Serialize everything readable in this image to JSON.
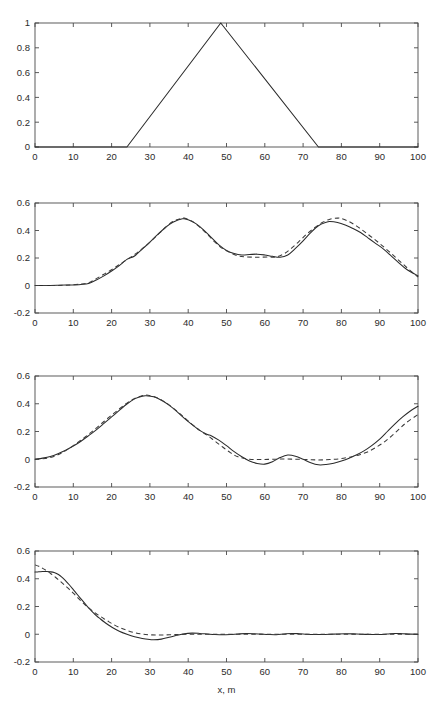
{
  "figure": {
    "background": "#ffffff",
    "line_color": "#2a2a2a",
    "axis_color": "#4a4a4a",
    "x_axis_label": "x, m"
  },
  "chart_data": [
    {
      "type": "line",
      "panel_index": 1,
      "panel_name": "initial-triangular-pulse",
      "title": "",
      "xlabel": "",
      "ylabel": "",
      "xlim": [
        0,
        100
      ],
      "ylim": [
        0,
        1
      ],
      "xticks": [
        0,
        10,
        20,
        30,
        40,
        50,
        60,
        70,
        80,
        90,
        100
      ],
      "yticks": [
        0,
        0.2,
        0.4,
        0.6,
        0.8,
        1
      ],
      "xticklabels": [
        "0",
        "10",
        "20",
        "30",
        "40",
        "50",
        "60",
        "70",
        "80",
        "90",
        "100"
      ],
      "yticklabels": [
        "0",
        "0.2",
        "0.4",
        "0.6",
        "0.8",
        "1"
      ],
      "grid": false,
      "legend": null,
      "series": [
        {
          "name": "triangular pulse",
          "style": "solid",
          "x": [
            0,
            24,
            48.5,
            74,
            100
          ],
          "y": [
            0,
            0,
            1,
            0,
            0
          ]
        }
      ]
    },
    {
      "type": "line",
      "panel_index": 2,
      "panel_name": "double-hump-response",
      "title": "",
      "xlabel": "",
      "ylabel": "",
      "xlim": [
        0,
        100
      ],
      "ylim": [
        -0.2,
        0.6
      ],
      "xticks": [
        0,
        10,
        20,
        30,
        40,
        50,
        60,
        70,
        80,
        90,
        100
      ],
      "yticks": [
        -0.2,
        0,
        0.2,
        0.4,
        0.6
      ],
      "xticklabels": [
        "0",
        "10",
        "20",
        "30",
        "40",
        "50",
        "60",
        "70",
        "80",
        "90",
        "100"
      ],
      "yticklabels": [
        "-0.2",
        "0",
        "0.2",
        "0.4",
        "0.6"
      ],
      "grid": false,
      "legend": null,
      "series": [
        {
          "name": "computed (solid)",
          "style": "solid",
          "x": [
            0,
            4,
            8,
            12,
            14,
            16,
            18,
            20,
            22,
            24,
            26,
            28,
            30,
            32,
            34,
            36,
            38.5,
            40,
            42,
            44,
            46,
            48,
            50,
            52,
            54,
            56,
            58,
            60,
            62,
            64,
            66,
            68,
            70,
            72,
            74,
            76,
            77,
            79,
            81,
            83,
            85,
            87,
            89,
            91,
            93,
            95,
            97,
            100
          ],
          "y": [
            0.0,
            0.0,
            0.003,
            0.008,
            0.015,
            0.04,
            0.07,
            0.105,
            0.145,
            0.19,
            0.215,
            0.265,
            0.315,
            0.37,
            0.42,
            0.46,
            0.485,
            0.478,
            0.45,
            0.405,
            0.35,
            0.295,
            0.255,
            0.232,
            0.222,
            0.225,
            0.228,
            0.222,
            0.212,
            0.205,
            0.222,
            0.27,
            0.325,
            0.385,
            0.435,
            0.46,
            0.465,
            0.458,
            0.44,
            0.415,
            0.385,
            0.345,
            0.305,
            0.265,
            0.215,
            0.165,
            0.118,
            0.07
          ]
        },
        {
          "name": "reference (dashed)",
          "style": "dashed",
          "x": [
            0,
            4,
            8,
            12,
            14,
            16,
            18,
            20,
            22,
            24,
            26,
            28,
            30,
            32,
            34,
            36,
            38,
            39,
            41,
            43,
            45,
            47,
            49,
            51,
            53,
            55,
            58,
            61,
            63,
            65,
            67,
            69,
            71,
            73,
            75,
            77,
            79,
            80,
            82,
            84,
            86,
            88,
            90,
            92,
            94,
            96,
            98,
            100
          ],
          "y": [
            0.0,
            0.0,
            0.002,
            0.01,
            0.02,
            0.05,
            0.082,
            0.115,
            0.152,
            0.188,
            0.225,
            0.268,
            0.315,
            0.368,
            0.422,
            0.465,
            0.487,
            0.49,
            0.468,
            0.425,
            0.372,
            0.315,
            0.268,
            0.238,
            0.215,
            0.208,
            0.206,
            0.207,
            0.208,
            0.23,
            0.272,
            0.322,
            0.375,
            0.42,
            0.458,
            0.482,
            0.49,
            0.487,
            0.465,
            0.432,
            0.392,
            0.35,
            0.305,
            0.258,
            0.208,
            0.158,
            0.108,
            0.062
          ]
        }
      ]
    },
    {
      "type": "line",
      "panel_index": 3,
      "panel_name": "single-hump-response",
      "title": "",
      "xlabel": "",
      "ylabel": "",
      "xlim": [
        0,
        100
      ],
      "ylim": [
        -0.2,
        0.6
      ],
      "xticks": [
        0,
        10,
        20,
        30,
        40,
        50,
        60,
        70,
        80,
        90,
        100
      ],
      "yticks": [
        -0.2,
        0,
        0.2,
        0.4,
        0.6
      ],
      "xticklabels": [
        "0",
        "10",
        "20",
        "30",
        "40",
        "50",
        "60",
        "70",
        "80",
        "90",
        "100"
      ],
      "yticklabels": [
        "-0.2",
        "0",
        "0.2",
        "0.4",
        "0.6"
      ],
      "grid": false,
      "legend": null,
      "series": [
        {
          "name": "computed (solid)",
          "style": "solid",
          "x": [
            0,
            2,
            4,
            6,
            8,
            10,
            12,
            14,
            16,
            18,
            20,
            22,
            24,
            26,
            28,
            29,
            31,
            33,
            35,
            37,
            39,
            41,
            43,
            45,
            46,
            48,
            50,
            52,
            54,
            56,
            58,
            60,
            62,
            64,
            66,
            68,
            70,
            72,
            74,
            76,
            78,
            80,
            82,
            84,
            86,
            88,
            90,
            92,
            94,
            96,
            98,
            100
          ],
          "y": [
            0.0,
            0.008,
            0.02,
            0.04,
            0.065,
            0.095,
            0.13,
            0.17,
            0.212,
            0.258,
            0.305,
            0.352,
            0.398,
            0.435,
            0.455,
            0.458,
            0.45,
            0.425,
            0.39,
            0.345,
            0.295,
            0.25,
            0.208,
            0.178,
            0.17,
            0.138,
            0.098,
            0.055,
            0.018,
            -0.012,
            -0.03,
            -0.035,
            -0.018,
            0.012,
            0.03,
            0.022,
            0.0,
            -0.025,
            -0.04,
            -0.038,
            -0.028,
            -0.012,
            0.008,
            0.032,
            0.062,
            0.1,
            0.145,
            0.2,
            0.255,
            0.305,
            0.348,
            0.382
          ]
        },
        {
          "name": "reference (dashed)",
          "style": "dashed",
          "x": [
            0,
            2,
            4,
            6,
            8,
            10,
            12,
            14,
            16,
            18,
            20,
            22,
            24,
            26,
            28,
            29.5,
            31,
            33,
            35,
            37,
            39,
            41,
            43,
            45,
            47,
            49,
            51,
            53,
            56,
            59,
            62,
            65,
            68,
            71,
            74,
            77,
            80,
            83,
            85,
            87,
            89,
            91,
            93,
            95,
            97,
            100
          ],
          "y": [
            0.0,
            0.003,
            0.012,
            0.032,
            0.062,
            0.098,
            0.138,
            0.18,
            0.225,
            0.272,
            0.318,
            0.362,
            0.405,
            0.438,
            0.458,
            0.462,
            0.452,
            0.428,
            0.392,
            0.348,
            0.3,
            0.252,
            0.208,
            0.172,
            0.13,
            0.088,
            0.048,
            0.018,
            0.0,
            -0.002,
            0.0,
            0.002,
            0.0,
            -0.002,
            -0.005,
            -0.002,
            0.005,
            0.02,
            0.035,
            0.055,
            0.085,
            0.12,
            0.165,
            0.215,
            0.265,
            0.322
          ]
        }
      ]
    },
    {
      "type": "line",
      "panel_index": 4,
      "panel_name": "decaying-front-response",
      "title": "",
      "xlabel": "x, m",
      "ylabel": "",
      "xlim": [
        0,
        100
      ],
      "ylim": [
        -0.2,
        0.6
      ],
      "xticks": [
        0,
        10,
        20,
        30,
        40,
        50,
        60,
        70,
        80,
        90,
        100
      ],
      "yticks": [
        -0.2,
        0,
        0.2,
        0.4,
        0.6
      ],
      "xticklabels": [
        "0",
        "10",
        "20",
        "30",
        "40",
        "50",
        "60",
        "70",
        "80",
        "90",
        "100"
      ],
      "yticklabels": [
        "-0.2",
        "0",
        "0.2",
        "0.4",
        "0.6"
      ],
      "grid": false,
      "legend": null,
      "series": [
        {
          "name": "computed (solid)",
          "style": "solid",
          "x": [
            0,
            1,
            2,
            3,
            4,
            5,
            6,
            7,
            8,
            9,
            10,
            11,
            12,
            13,
            14,
            15,
            16,
            17,
            18,
            19,
            20,
            22,
            24,
            26,
            28,
            30,
            31,
            33,
            35,
            37,
            39,
            41,
            43,
            45,
            47,
            49,
            51,
            53,
            55,
            57,
            59,
            61,
            63,
            65,
            67,
            69,
            71,
            73,
            75,
            78,
            81,
            84,
            87,
            90,
            92,
            94,
            96,
            98,
            100
          ],
          "y": [
            0.448,
            0.45,
            0.452,
            0.452,
            0.45,
            0.445,
            0.432,
            0.412,
            0.385,
            0.355,
            0.322,
            0.288,
            0.255,
            0.222,
            0.19,
            0.162,
            0.135,
            0.112,
            0.09,
            0.07,
            0.052,
            0.022,
            0.0,
            -0.018,
            -0.03,
            -0.038,
            -0.04,
            -0.035,
            -0.022,
            -0.008,
            0.004,
            0.008,
            0.006,
            0.002,
            -0.002,
            -0.004,
            -0.002,
            0.002,
            0.005,
            0.004,
            0.001,
            -0.002,
            -0.003,
            0.002,
            0.006,
            0.004,
            0.0,
            -0.002,
            -0.002,
            0.001,
            0.004,
            0.002,
            -0.001,
            -0.002,
            0.002,
            0.006,
            0.004,
            0.001,
            0.0
          ]
        },
        {
          "name": "reference (dashed)",
          "style": "dashed",
          "x": [
            0,
            1,
            2,
            3,
            4,
            5,
            6,
            7,
            8,
            9,
            10,
            11,
            12,
            13,
            14,
            15,
            16,
            17,
            18,
            19,
            20,
            22,
            24,
            26,
            28,
            30,
            32,
            34,
            36,
            38,
            41,
            44,
            48,
            52,
            56,
            60,
            64,
            68,
            72,
            76,
            80,
            84,
            88,
            92,
            96,
            100
          ],
          "y": [
            0.5,
            0.49,
            0.475,
            0.458,
            0.44,
            0.418,
            0.396,
            0.372,
            0.348,
            0.322,
            0.296,
            0.268,
            0.24,
            0.214,
            0.19,
            0.168,
            0.148,
            0.13,
            0.112,
            0.095,
            0.078,
            0.05,
            0.028,
            0.012,
            0.002,
            -0.004,
            -0.006,
            -0.005,
            -0.003,
            -0.001,
            0.0,
            0.0,
            0.0,
            0.0,
            0.0,
            0.0,
            0.0,
            0.0,
            0.0,
            0.0,
            0.0,
            0.0,
            0.0,
            0.0,
            0.0,
            0.0
          ]
        }
      ]
    }
  ]
}
